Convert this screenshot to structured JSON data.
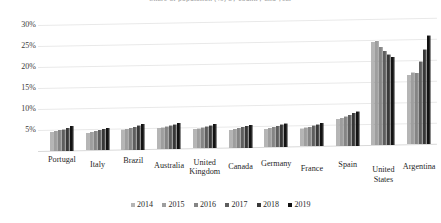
{
  "chart_data": {
    "type": "bar",
    "title": "Share of population (%) by country and year",
    "xlabel": "",
    "ylabel": "",
    "ylim": [
      0,
      30
    ],
    "yticks": [
      30,
      25,
      20,
      15,
      10,
      5
    ],
    "ytick_labels": [
      "30%",
      "25%",
      "20%",
      "15%",
      "10%",
      "5%"
    ],
    "grid": true,
    "legend_position": "bottom",
    "categories": [
      "Portugal",
      "Italy",
      "Brazil",
      "Australia",
      "United Kingdom",
      "Canada",
      "Germany",
      "France",
      "Spain",
      "United States",
      "Argentina"
    ],
    "series": [
      {
        "name": "2014",
        "color": "#b5b5b5",
        "values": [
          4.6,
          4.2,
          4.8,
          5.0,
          4.6,
          4.3,
          4.4,
          4.3,
          6.4,
          24.6,
          16.6
        ]
      },
      {
        "name": "2015",
        "color": "#9e9e9e",
        "values": [
          4.8,
          4.4,
          5.0,
          5.2,
          4.8,
          4.5,
          4.6,
          4.5,
          6.7,
          24.8,
          17.2
        ]
      },
      {
        "name": "2016",
        "color": "#858585",
        "values": [
          5.0,
          4.6,
          5.2,
          5.4,
          5.0,
          4.7,
          4.8,
          4.7,
          7.0,
          23.4,
          17.0
        ]
      },
      {
        "name": "2017",
        "color": "#5e5e5e",
        "values": [
          5.2,
          4.9,
          5.5,
          5.6,
          5.3,
          5.0,
          5.1,
          5.0,
          7.4,
          22.4,
          19.8
        ]
      },
      {
        "name": "2018",
        "color": "#383838",
        "values": [
          5.5,
          5.1,
          5.8,
          5.9,
          5.5,
          5.2,
          5.4,
          5.3,
          7.8,
          21.6,
          22.6
        ]
      },
      {
        "name": "2019",
        "color": "#121212",
        "values": [
          6.0,
          5.4,
          6.1,
          6.2,
          5.8,
          5.5,
          5.7,
          5.6,
          8.2,
          21.0,
          26.0
        ]
      }
    ]
  },
  "legend": {
    "items": [
      "2014",
      "2015",
      "2016",
      "2017",
      "2018",
      "2019"
    ]
  }
}
